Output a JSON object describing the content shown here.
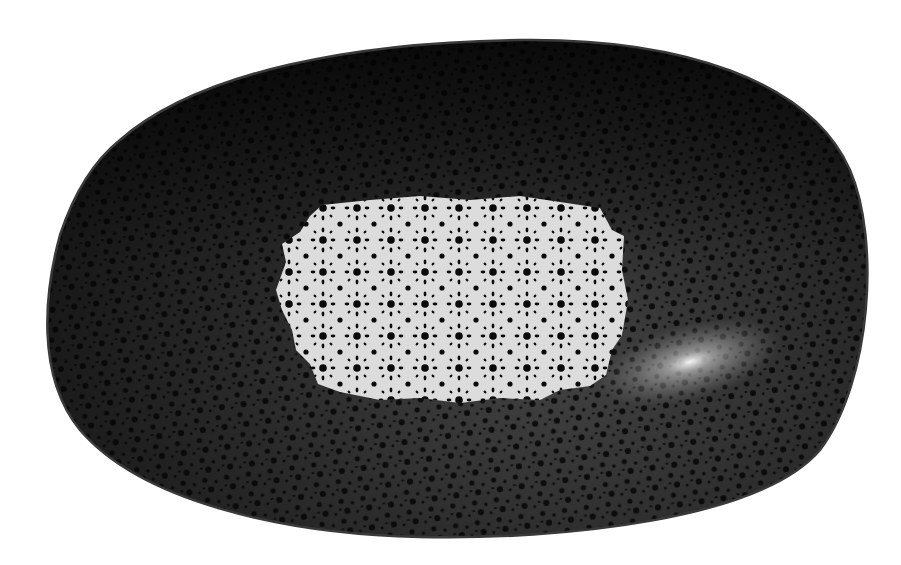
{
  "image": {
    "description": "Oval black ceramic serving dish with speckled dot glaze pattern and a white rectangular-ish patterned center area",
    "background_color": "#ffffff",
    "dish": {
      "shape": "rounded oval",
      "base_color": "#1a1a1a",
      "rim_color": "#3a3a3a",
      "dot_color": "#050505",
      "highlight_color": "#e6e6e6"
    },
    "center_patch": {
      "color": "#dcdcdc",
      "dot_color": "#0a0a0a",
      "pattern": "star-like clusters of black dots"
    }
  }
}
